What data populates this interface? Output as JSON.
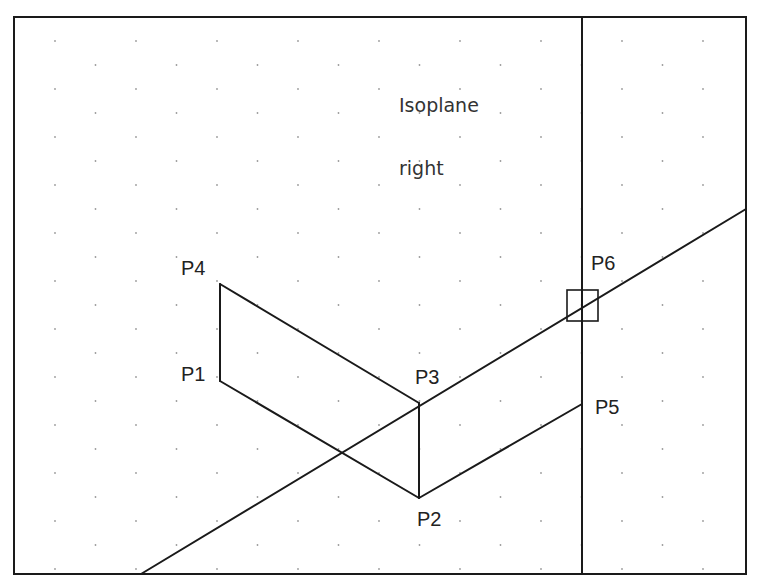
{
  "annotation": {
    "lines": [
      "Isoplane",
      "right"
    ]
  },
  "points": [
    {
      "id": "P1",
      "label": "P1",
      "x": 220,
      "y": 381,
      "label_x": 181,
      "label_y": 364
    },
    {
      "id": "P2",
      "label": "P2",
      "x": 419,
      "y": 498,
      "label_x": 417,
      "label_y": 509
    },
    {
      "id": "P3",
      "label": "P3",
      "x": 419,
      "y": 403,
      "label_x": 415,
      "label_y": 367
    },
    {
      "id": "P4",
      "label": "P4",
      "x": 220,
      "y": 284,
      "label_x": 181,
      "label_y": 258
    },
    {
      "id": "P5",
      "label": "P5",
      "x": 582,
      "y": 404,
      "label_x": 595,
      "label_y": 397
    },
    {
      "id": "P6",
      "label": "P6",
      "x": 582,
      "y": 306,
      "label_x": 591,
      "label_y": 253
    }
  ],
  "frame": {
    "left": 14,
    "top": 17,
    "right": 746,
    "bottom": 574,
    "divider_x": 582
  },
  "segments": [
    {
      "name": "edge-p1-p4",
      "from": [
        220,
        381
      ],
      "to": [
        220,
        284
      ]
    },
    {
      "name": "edge-p4-p3",
      "from": [
        220,
        284
      ],
      "to": [
        419,
        403
      ]
    },
    {
      "name": "edge-p1-p2",
      "from": [
        220,
        381
      ],
      "to": [
        419,
        498
      ]
    },
    {
      "name": "edge-p3-p2",
      "from": [
        419,
        403
      ],
      "to": [
        419,
        498
      ]
    },
    {
      "name": "edge-p2-p5",
      "from": [
        419,
        498
      ],
      "to": [
        582,
        404
      ]
    },
    {
      "name": "construction-line",
      "from": [
        141,
        574
      ],
      "to": [
        746,
        209
      ]
    }
  ],
  "snap_marker": {
    "x": 567,
    "y": 290,
    "size": 31
  },
  "grid": {
    "dx": 81,
    "dy": 24,
    "x0": 55,
    "y0": 41,
    "dot_color": "#9a9a9a"
  },
  "colors": {
    "line": "#1a1a1a",
    "background": "#ffffff",
    "text": "#222222"
  }
}
